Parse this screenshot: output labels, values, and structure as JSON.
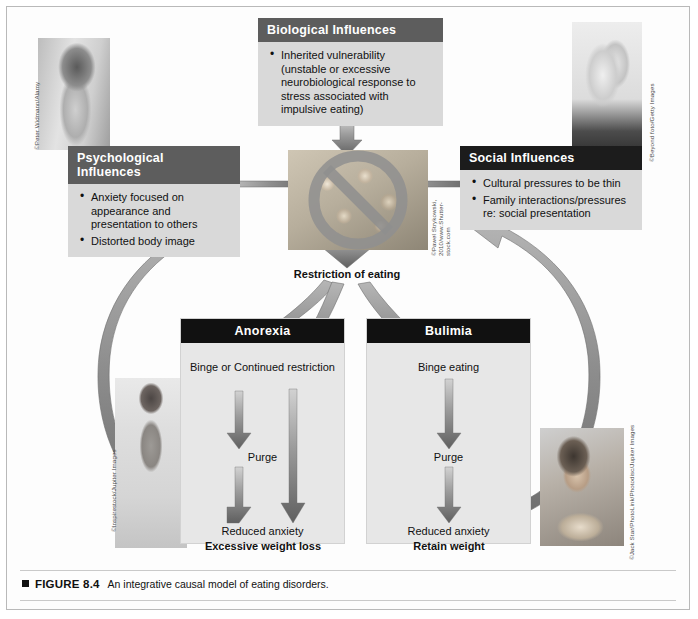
{
  "figure": {
    "marker": "square-marker",
    "number": "FIGURE 8.4",
    "caption": "An integrative causal model of eating disorders."
  },
  "panels": {
    "biological": {
      "title": "Biological Influences",
      "bullets": [
        "Inherited vulnerability (unstable or excessive neurobiological response to stress associated with impulsive eating)"
      ]
    },
    "psychological": {
      "title": "Psychological Influences",
      "bullets": [
        "Anxiety focused on appearance and presentation to others",
        "Distorted body image"
      ]
    },
    "social": {
      "title": "Social Influences",
      "bullets": [
        "Cultural pressures to be thin",
        "Family interactions/pressures re: social presentation"
      ]
    }
  },
  "center": {
    "restriction_label": "Restriction of eating"
  },
  "disorders": [
    {
      "title": "Anorexia",
      "nodes": [
        "Binge or Continued restriction",
        "Purge",
        "Reduced anxiety"
      ],
      "outcome": "Excessive weight loss"
    },
    {
      "title": "Bulimia",
      "nodes": [
        "Binge eating",
        "Purge",
        "Reduced anxiety"
      ],
      "outcome": "Retain weight"
    }
  ],
  "photo_credits": {
    "top_left": "©Peter Widmann/Alamy",
    "top_right": "©Beyond foto/Getty Images",
    "center": "©Pawel Strykowski, 2010/www.Shutter-stock.com",
    "bottom_left": "©Inspirestock/Jupiter Images",
    "bottom_right": "©Jack Star/PhotoLink/Photodisc/Jupiter Images"
  },
  "colors": {
    "panel_header": "#5d5d5d",
    "panel_header_dark": "#1c1c1c",
    "panel_body": "#d9d9d9",
    "disorder_header": "#111111",
    "disorder_body": "#e7e7e7",
    "arrow_gray": "#8e8e8e",
    "frame": "#b9b9b9"
  }
}
